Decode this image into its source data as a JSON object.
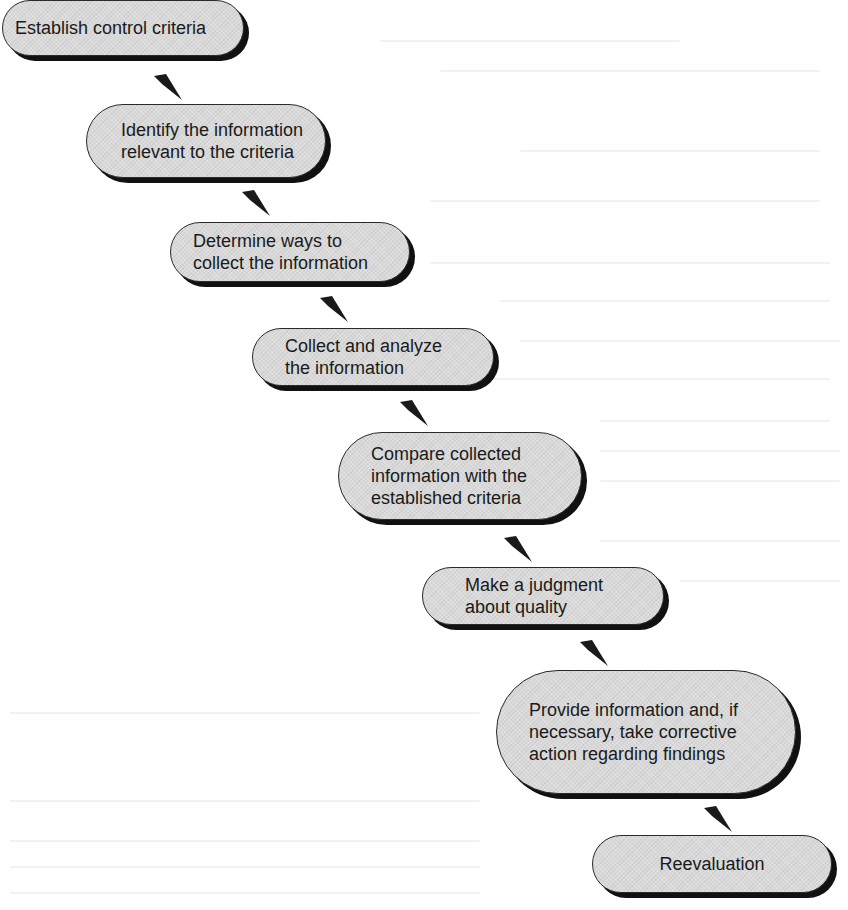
{
  "diagram": {
    "type": "process-flow",
    "direction": "diagonal-down-right",
    "colors": {
      "node_fill": "#d9d9d9",
      "node_border": "#2a2a2a",
      "node_shadow": "#111111",
      "arrow": "#1a1a1a",
      "text": "#1a1a1a",
      "background": "#ffffff"
    },
    "steps": [
      {
        "label": "Establish control criteria"
      },
      {
        "label": "Identify the information\nrelevant to the criteria"
      },
      {
        "label": "Determine ways to\ncollect the information"
      },
      {
        "label": "Collect and analyze\nthe information"
      },
      {
        "label": "Compare collected\ninformation with the\nestablished criteria"
      },
      {
        "label": "Make a judgment\nabout quality"
      },
      {
        "label": "Provide information and, if\nnecessary, take corrective\naction regarding findings"
      },
      {
        "label": "Reevaluation"
      }
    ],
    "edges": [
      {
        "from": 0,
        "to": 1
      },
      {
        "from": 1,
        "to": 2
      },
      {
        "from": 2,
        "to": 3
      },
      {
        "from": 3,
        "to": 4
      },
      {
        "from": 4,
        "to": 5
      },
      {
        "from": 5,
        "to": 6
      },
      {
        "from": 6,
        "to": 7
      }
    ]
  }
}
